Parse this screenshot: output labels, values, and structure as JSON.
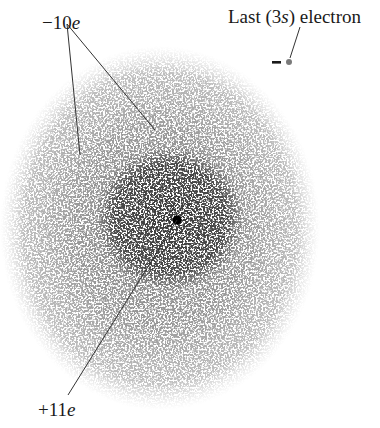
{
  "diagram": {
    "labels": {
      "core_electrons": {
        "sign": "−10",
        "symbol": "e"
      },
      "nucleus": {
        "sign": "+11",
        "symbol": "e"
      },
      "valence": {
        "prefix": "Last (3",
        "orbital": "s",
        "suffix": ") electron"
      },
      "valence_charge": "−"
    },
    "colors": {
      "ink": "#1a1a1a",
      "outer_cloud": "#8a8a8a",
      "inner_cloud": "#555555",
      "nucleus": "#000000",
      "electron_dot": "#7a7a7a"
    }
  }
}
